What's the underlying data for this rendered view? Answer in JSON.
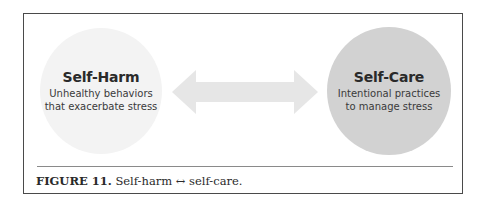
{
  "figure": {
    "left_node": {
      "title": "Self-Harm",
      "description_line1": "Unhealthy behaviors",
      "description_line2": "that exacerbate stress",
      "fill_color": "#f3f3f3"
    },
    "right_node": {
      "title": "Self-Care",
      "description_line1": "Intentional practices",
      "description_line2": "to manage stress",
      "fill_color": "#d2d2d2"
    },
    "connector": {
      "type": "double-headed-arrow",
      "color": "#e6e6e6"
    },
    "caption": {
      "label": "FIGURE 11.",
      "text": "Self-harm ↔ self-care."
    }
  }
}
